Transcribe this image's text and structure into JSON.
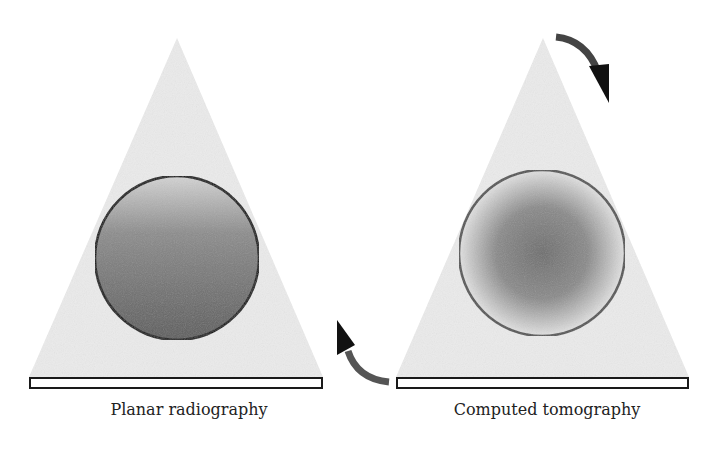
{
  "panels": [
    {
      "id": "planar",
      "caption": "Planar radiography",
      "description": "X-ray beam (triangle) through object (sphere) onto flat detector; object appears with superimposed depth gradient"
    },
    {
      "id": "ct",
      "caption": "Computed tomography",
      "description": "Rotating source/detector (curved arrows) reconstructs object cross-section with radial density profile"
    }
  ],
  "arrows": {
    "rotation_top": "clockwise-arrow",
    "rotation_bottom": "counterclockwise-arrow"
  },
  "colors": {
    "beam": "#ececec",
    "detector_fill": "#ffffff",
    "detector_stroke": "#1a1a1a",
    "planar_sphere_top": "#d0d0d0",
    "planar_sphere_bottom": "#5a5a5a",
    "ct_sphere_center": "#6a6a6a",
    "ct_sphere_edge": "#e0e0e0",
    "arrow": "#3a3a3a"
  }
}
